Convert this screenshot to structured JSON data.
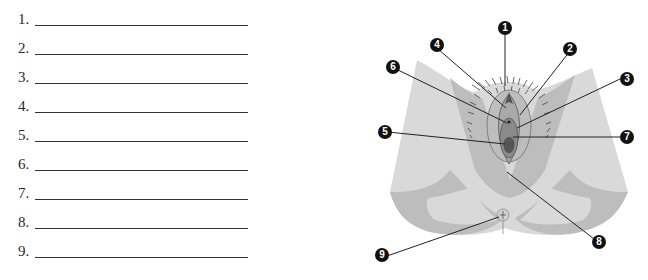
{
  "worksheet": {
    "blanks": [
      {
        "number": "1.",
        "answer": ""
      },
      {
        "number": "2.",
        "answer": ""
      },
      {
        "number": "3.",
        "answer": ""
      },
      {
        "number": "4.",
        "answer": ""
      },
      {
        "number": "5.",
        "answer": ""
      },
      {
        "number": "6.",
        "answer": ""
      },
      {
        "number": "7.",
        "answer": ""
      },
      {
        "number": "8.",
        "answer": ""
      },
      {
        "number": "9.",
        "answer": ""
      }
    ]
  },
  "figure": {
    "callouts": [
      "1",
      "2",
      "3",
      "4",
      "5",
      "6",
      "7",
      "8",
      "9"
    ],
    "colors": {
      "skin_light": "#d9d9d9",
      "skin_mid": "#bdbdbd",
      "skin_dark": "#a9a9a9",
      "inner_dark": "#6e6e6e",
      "badge": "#111111",
      "leader_line": "#222222"
    }
  }
}
